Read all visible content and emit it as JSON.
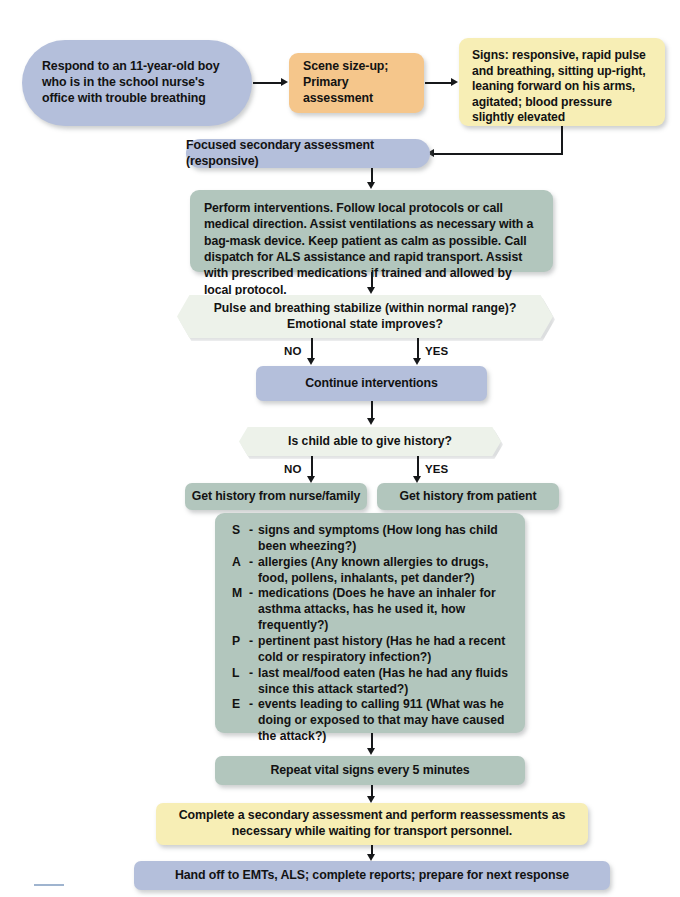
{
  "diagram": {
    "colors": {
      "blue": "#b4bfdb",
      "orange": "#f5c68b",
      "yellow": "#f7eeb5",
      "green": "#b2c6bd",
      "decision": "#edf2ea",
      "arrow": "#16181a"
    }
  },
  "nodes": {
    "dispatch": "Respond to an 11-year-old boy who is in the school nurse's office with trouble breathing",
    "scene_size_up_line1": "Scene size-up;",
    "scene_size_up_line2": "Primary assessment",
    "signs": "Signs: responsive, rapid pulse and breathing, sitting up-right, leaning forward on his arms, agitated; blood pressure slightly elevated",
    "focused_secondary": "Focused secondary assessment (responsive)",
    "interventions": "Perform interventions. Follow local protocols or call medical direction. Assist ventilations as necessary with a bag-mask device. Keep patient as calm as possible. Call dispatch for ALS assistance and rapid transport. Assist with prescribed medications if trained and allowed by local protocol.",
    "decision_stabilize_line1": "Pulse and breathing stabilize (within normal range)?",
    "decision_stabilize_line2": "Emotional state improves?",
    "continue_interventions": "Continue interventions",
    "decision_history": "Is child able to give history?",
    "history_nurse_family": "Get history from nurse/family",
    "history_patient": "Get history from patient",
    "repeat_vitals": "Repeat vital signs every 5 minutes",
    "complete_secondary": "Complete a secondary assessment and perform reassessments as necessary while waiting for transport personnel.",
    "hand_off": "Hand off to EMTs, ALS; complete reports; prepare for next response"
  },
  "branch_labels": {
    "stabilize_no": "NO",
    "stabilize_yes": "YES",
    "history_no": "NO",
    "history_yes": "YES"
  },
  "sample_history": [
    {
      "key": "S",
      "dash": "-",
      "text": "signs and symptoms (How long has child been wheezing?)"
    },
    {
      "key": "A",
      "dash": "-",
      "text": "allergies (Any known allergies to drugs, food, pollens, inhalants, pet dander?)"
    },
    {
      "key": "M",
      "dash": "-",
      "text": "medications (Does he have an inhaler for asthma attacks, has he used it, how frequently?)"
    },
    {
      "key": "P",
      "dash": "-",
      "text": "pertinent past history (Has he had a recent cold or respiratory infection?)"
    },
    {
      "key": "L",
      "dash": "-",
      "text": "last meal/food eaten (Has he had any fluids since this attack started?)"
    },
    {
      "key": "E",
      "dash": "-",
      "text": "events leading to calling 911 (What was he doing or exposed to that may have caused the attack?)"
    }
  ]
}
